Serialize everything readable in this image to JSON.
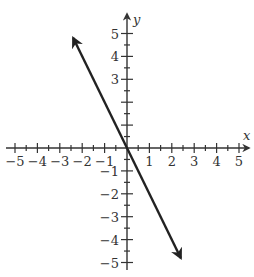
{
  "chart_data": {
    "type": "line",
    "title": "",
    "xlabel": "x",
    "ylabel": "y",
    "xlim": [
      -5,
      5
    ],
    "ylim": [
      -5,
      5
    ],
    "grid": false,
    "x_ticks": [
      -5,
      -4,
      -3,
      -2,
      -1,
      1,
      2,
      3,
      4,
      5
    ],
    "y_ticks": [
      -5,
      -4,
      -3,
      -2,
      -1,
      3,
      4,
      5
    ],
    "x_tick_labels": [
      "−5",
      "−4",
      "−3",
      "−2",
      "−1",
      "1",
      "2",
      "3",
      "4",
      "5"
    ],
    "y_tick_labels_positive": [
      "5",
      "4",
      "3"
    ],
    "y_tick_labels_negative": [
      "−1",
      "−2",
      "−3",
      "−4",
      "−5"
    ],
    "minor_ticks_per_unit": 2,
    "series": [
      {
        "name": "line",
        "equation": "y = -2x",
        "slope": -2,
        "intercept": 0,
        "x": [
          -2.4,
          0,
          2.4
        ],
        "y": [
          4.8,
          0,
          -4.8
        ],
        "arrows_both_ends": true,
        "color": "#222222"
      }
    ]
  }
}
